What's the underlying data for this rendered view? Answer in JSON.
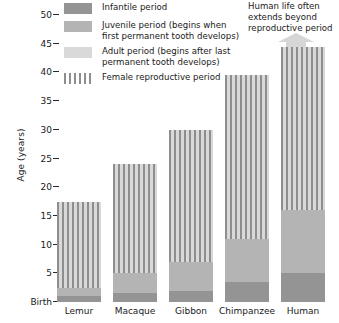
{
  "chart": {
    "ylabel": "Age (years)",
    "baseline_label": "Birth",
    "yticks": [
      "50",
      "45",
      "40",
      "35",
      "30",
      "25",
      "20",
      "15",
      "10",
      "5"
    ],
    "ylim_low": 0,
    "ylim_high": 50
  },
  "legend": {
    "items": [
      {
        "key": "infantile",
        "label": "Infantile period",
        "color": "#949494"
      },
      {
        "key": "juvenile",
        "label": "Juvenile period  (begins when first permanent tooth develops)",
        "color": "#b4b4b4"
      },
      {
        "key": "adult",
        "label": "Adult period (begins after last permanent tooth develops)",
        "color": "#d9d9d9"
      },
      {
        "key": "repro",
        "label": "Female reproductive period",
        "color": "#8e8e8e"
      }
    ]
  },
  "annotation": {
    "human_note": "Human life often extends beyond reproductive period",
    "arrow": "up-arrow-icon"
  },
  "chart_data": {
    "type": "bar",
    "title": "",
    "xlabel": "",
    "ylabel": "Age (years)",
    "ylim": [
      0,
      50
    ],
    "yticks": [
      0,
      5,
      10,
      15,
      20,
      25,
      30,
      35,
      40,
      45,
      50
    ],
    "ytick_labels": [
      "Birth",
      "5",
      "10",
      "15",
      "20",
      "25",
      "30",
      "35",
      "40",
      "45",
      "50"
    ],
    "grid": false,
    "legend_position": "top-left",
    "stacked": true,
    "categories": [
      "Lemur",
      "Macaque",
      "Gibbon",
      "Chimpanzee",
      "Human"
    ],
    "total_lifespan": [
      17.5,
      24,
      30,
      39.5,
      44.5
    ],
    "series": [
      {
        "name": "Infantile period",
        "color": "#949494",
        "values": [
          1.0,
          1.5,
          2.0,
          3.5,
          5.0
        ]
      },
      {
        "name": "Juvenile period",
        "color": "#b4b4b4",
        "values": [
          1.5,
          3.5,
          5.0,
          7.5,
          11.0
        ]
      },
      {
        "name": "Adult period",
        "color": "#d9d9d9",
        "values": [
          15.0,
          19.0,
          23.0,
          28.5,
          28.5
        ]
      }
    ],
    "segment_boundaries_years": {
      "Lemur": {
        "infantile_end": 1.0,
        "juvenile_end": 2.5,
        "adult_end": 17.5
      },
      "Macaque": {
        "infantile_end": 1.5,
        "juvenile_end": 5.0,
        "adult_end": 24.0
      },
      "Gibbon": {
        "infantile_end": 2.0,
        "juvenile_end": 7.0,
        "adult_end": 30.0
      },
      "Chimpanzee": {
        "infantile_end": 3.5,
        "juvenile_end": 11.0,
        "adult_end": 39.5
      },
      "Human": {
        "infantile_end": 5.0,
        "juvenile_end": 16.0,
        "adult_end": 44.5
      }
    },
    "female_reproductive_period_years": {
      "Lemur": [
        2.5,
        17.5
      ],
      "Macaque": [
        5.0,
        24.0
      ],
      "Gibbon": [
        7.0,
        30.0
      ],
      "Chimpanzee": [
        11.0,
        39.5
      ],
      "Human": [
        16.0,
        44.5
      ]
    },
    "annotations": [
      {
        "target": "Human",
        "text": "Human life often extends beyond reproductive period"
      }
    ]
  }
}
